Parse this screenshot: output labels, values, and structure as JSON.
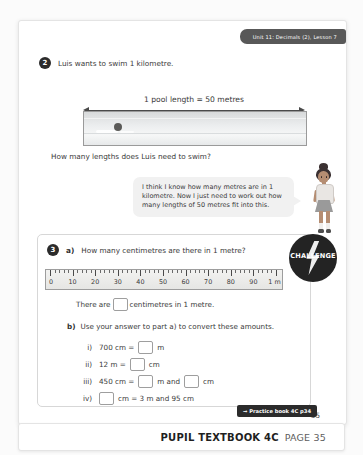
{
  "header": {
    "unit_tab": "Unit 11: Decimals (2), Lesson 7"
  },
  "question2": {
    "number": "2",
    "prompt": "Luis wants to swim 1 kilometre.",
    "pool_label": "1 pool length = 50 metres",
    "image_alt": "swimming-pool-photo",
    "ask": "How many lengths does Luis need to swim?",
    "speech_bubble": "I think I know how many metres are in 1 kilometre. Now I just need to work out how many lengths of 50 metres fit into this.",
    "character_alt": "girl-character"
  },
  "question3": {
    "number": "3",
    "part_a_letter": "a)",
    "part_a_prompt": "How many centimetres are there in 1 metre?",
    "challenge_label": "CHALLENGE",
    "ruler": {
      "labels": [
        "0",
        "10",
        "20",
        "30",
        "40",
        "50",
        "60",
        "70",
        "80",
        "90",
        "1 m"
      ],
      "min": 0,
      "max": 100,
      "minor_step": 2,
      "major_step": 10
    },
    "statement_before": "There are",
    "statement_after": "centimetres in 1 metre.",
    "part_b_letter": "b)",
    "part_b_prompt": "Use your answer to part a) to convert these amounts.",
    "items": [
      {
        "numeral": "i)",
        "segments": [
          {
            "t": "text",
            "v": "700 cm ="
          },
          {
            "t": "box"
          },
          {
            "t": "text",
            "v": "m"
          }
        ]
      },
      {
        "numeral": "ii)",
        "segments": [
          {
            "t": "text",
            "v": "12 m ="
          },
          {
            "t": "box"
          },
          {
            "t": "text",
            "v": "cm"
          }
        ]
      },
      {
        "numeral": "iii)",
        "segments": [
          {
            "t": "text",
            "v": "450 cm ="
          },
          {
            "t": "box"
          },
          {
            "t": "text",
            "v": "m and"
          },
          {
            "t": "box"
          },
          {
            "t": "text",
            "v": "cm"
          }
        ]
      },
      {
        "numeral": "iv)",
        "segments": [
          {
            "t": "box"
          },
          {
            "t": "text",
            "v": "cm = 3 m and 95 cm"
          }
        ]
      }
    ]
  },
  "footer": {
    "practice_badge": "→ Practice book 4C p34",
    "page_number": "35",
    "book_title": "PUPIL TEXTBOOK 4C",
    "book_page": "PAGE 35"
  },
  "colors": {
    "badge_dark": "#2b2b2b",
    "tab_grey": "#585858",
    "panel_border": "#d7d7d7",
    "bubble_bg": "#f1f1f1"
  }
}
